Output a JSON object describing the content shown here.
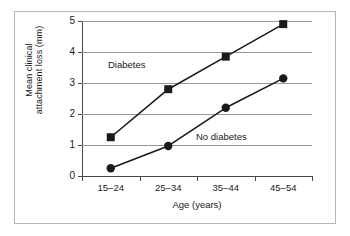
{
  "chart_data": {
    "type": "line",
    "title": "",
    "xlabel": "Age (years)",
    "ylabel": "Mean clinical attachment loss (mm)",
    "ylabel_line1": "Mean clinical",
    "ylabel_line2": "attachment loss (mm)",
    "categories": [
      "15–24",
      "25–34",
      "35–44",
      "45–54"
    ],
    "ylim": [
      0,
      5
    ],
    "yticks": [
      0,
      1,
      2,
      3,
      4,
      5
    ],
    "ytick_labels": [
      "0",
      "1",
      "2",
      "3",
      "4",
      "5"
    ],
    "grid": true,
    "legend_position": "inline-annotations",
    "series": [
      {
        "name": "Diabetes",
        "marker": "square",
        "color": "#1a1a1a",
        "values": [
          1.25,
          2.8,
          3.85,
          4.9
        ]
      },
      {
        "name": "No diabetes",
        "marker": "circle",
        "color": "#1a1a1a",
        "values": [
          0.25,
          0.97,
          2.2,
          3.15
        ]
      }
    ],
    "annotations": [
      {
        "text": "Diabetes",
        "series": "Diabetes"
      },
      {
        "text": "No diabetes",
        "series": "No diabetes"
      }
    ]
  },
  "colors": {
    "gridline": "#9a9a9a",
    "axis": "#4a4a4a",
    "frame": "#b6b6b6",
    "data": "#1a1a1a",
    "background": "#ffffff"
  }
}
